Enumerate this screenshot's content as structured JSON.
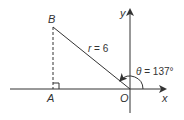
{
  "diagram": {
    "type": "polar-coordinate-triangle",
    "colors": {
      "line": "#333333",
      "background": "#ffffff"
    },
    "points": {
      "O": {
        "label": "O",
        "x": 130,
        "y": 89
      },
      "A": {
        "label": "A",
        "x": 53,
        "y": 89
      },
      "B": {
        "label": "B",
        "x": 53,
        "y": 27
      }
    },
    "axes": {
      "x_label": "x",
      "y_label": "y"
    },
    "segments": {
      "radius_label_var": "r",
      "radius_label_rest": " = 6",
      "radius_text": "r = 6"
    },
    "angle": {
      "symbol": "θ",
      "value_text": " = 137°",
      "text": "θ = 137°",
      "degrees": 137
    }
  }
}
